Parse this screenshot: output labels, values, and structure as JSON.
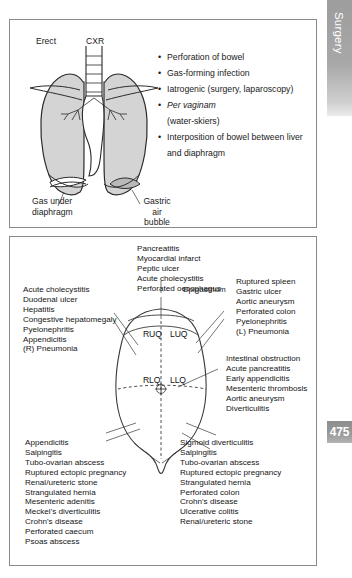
{
  "edge_tabs": {
    "section_label": "Surgery",
    "page_number": "475"
  },
  "top_panel": {
    "diagram": {
      "name": "erect-chest-xray-diagram",
      "labels": {
        "erect": "Erect",
        "cxr": "CXR",
        "gas_under_diaphragm": "Gas under\ndiaphragm",
        "gastric_air_bubble": "Gastric\nair\nbubble"
      }
    },
    "bullets": [
      {
        "text": "Perforation of bowel",
        "italic_part": ""
      },
      {
        "text": "Gas-forming infection",
        "italic_part": ""
      },
      {
        "text": "Iatrogenic (surgery, laparoscopy)",
        "italic_part": ""
      },
      {
        "text": "",
        "italic_part": "Per vaginam"
      },
      {
        "text": "(water-skiers)",
        "italic_part": "",
        "continuation": true
      },
      {
        "text": "Interposition of bowel between liver",
        "italic_part": ""
      },
      {
        "text": "and diaphragm",
        "italic_part": "",
        "continuation": true
      }
    ]
  },
  "bottom_panel": {
    "diagram": {
      "name": "abdominal-quadrants-diagram",
      "quadrants": [
        "RUQ",
        "LUQ",
        "RLQ",
        "LLQ"
      ],
      "epigastrium_label": "Epigastrium"
    },
    "blocks": {
      "top_centre": "Pancreatitis\nMyocardial infarct\nPeptic ulcer\nAcute cholecystitis\nPerforated oesophagus",
      "left_upper": "Acute cholecystitis\nDuodenal ulcer\nHepatitis\nCongestive hepatomegaly\nPyelonephritis\nAppendicitis\n(R) Pneumonia",
      "right_upper": "Ruptured spleen\nGastric ulcer\nAortic aneurysm\nPerforated colon\nPyelonephritis\n(L) Pneumonia",
      "right_middle": "Intestinal obstruction\nAcute pancreatitis\nEarly appendicitis\nMesenteric thrombosis\nAortic aneurysm\nDiverticulitis",
      "bottom_left": "Appendicitis\nSalpingitis\nTubo-ovarian abscess\nRuptured ectopic pregnancy\nRenal/ureteric stone\nStrangulated hernia\nMesenteric adenitis\nMeckel's diverticulitis\nCrohn's disease\nPerforated caecum\nPsoas abscess",
      "bottom_right": "Sigmoid diverticulitis\nSalpingitis\nTubo-ovarian abscess\nRuptured ectopic pregnancy\nStrangulated hernia\nPerforated colon\nCrohn's disease\nUlcerative colitis\nRenal/ureteric stone"
    }
  },
  "colors": {
    "panel_border": "#8a8a8a",
    "tab_gray": "#9d9d9d",
    "organ_fill": "#d4d4d4",
    "text": "#1a1a1a"
  }
}
